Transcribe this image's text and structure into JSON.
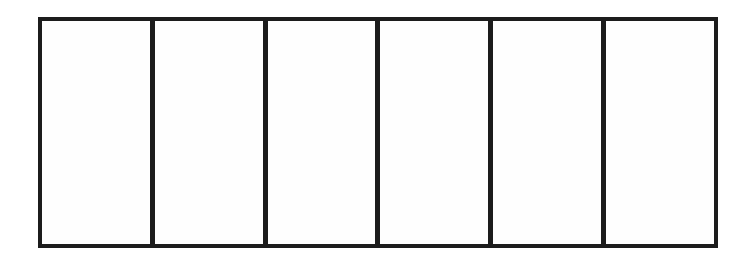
{
  "diagram": {
    "type": "partitioned-rectangle",
    "section_count": 6,
    "cells": [
      {
        "label": ""
      },
      {
        "label": ""
      },
      {
        "label": ""
      },
      {
        "label": ""
      },
      {
        "label": ""
      },
      {
        "label": ""
      }
    ],
    "colors": {
      "stroke": "#1c1c1c",
      "fill": "#fefefe",
      "background": "#ffffff"
    }
  }
}
